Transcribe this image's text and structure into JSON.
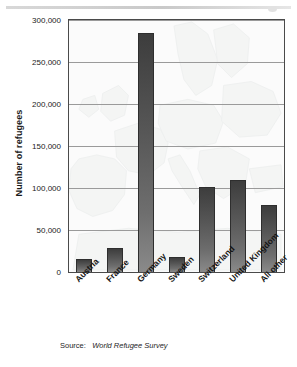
{
  "chart_data": {
    "type": "bar",
    "title": "",
    "subtitle": "",
    "xlabel": "",
    "ylabel": "Number of refugees",
    "categories": [
      "Austria",
      "France",
      "Germany",
      "Sweden",
      "Switzerland",
      "United Kingdom",
      "All other"
    ],
    "values": [
      15000,
      29000,
      285000,
      18000,
      101000,
      109000,
      80000
    ],
    "ylim": [
      0,
      300000
    ],
    "ytick_values": [
      0,
      50000,
      100000,
      150000,
      200000,
      250000,
      300000
    ],
    "ytick_labels": [
      "0",
      "50,000",
      "100,000",
      "150,000",
      "200,000",
      "250,000",
      "300,000"
    ],
    "grid": true,
    "gridlines": "horizontal",
    "legend": "none",
    "bar_color": "#565656",
    "background_watermark": "europe-map",
    "source_note": "Source: World Refugee Survey"
  },
  "source": {
    "prefix": "Source:",
    "title": "World Refugee Survey"
  },
  "colors": {
    "bar_dark": "#3d3d3d",
    "bar_light": "#8a8a8a",
    "axis": "#4a4a4a",
    "grid": "#9a9a9a",
    "plot_background": "#fbfbfb",
    "rule": "#d8d8d8"
  }
}
